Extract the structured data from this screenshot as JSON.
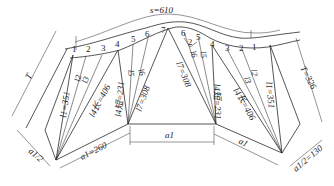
{
  "diagram": {
    "type": "sheet-metal pattern development (unfolded transition piece)",
    "arc_length_label": "s=610",
    "top_points_left": [
      "1",
      "2",
      "3",
      "4",
      "5",
      "6",
      "7"
    ],
    "top_points_right": [
      "6",
      "5",
      "4",
      "3",
      "2",
      "1"
    ],
    "labels": {
      "T_left": "T",
      "T_right": "T=326",
      "l1_left": "l1=351",
      "l1_right": "l1=351",
      "l4_long_left": "l4长=406",
      "l4_long_right": "l4长=406",
      "l4_short_left": "l4短=231",
      "l4_short_right": "l4短=231",
      "l7_left": "l7=308",
      "l7_right": "l7=308",
      "l2_left": "l2",
      "l3_left": "l3",
      "l5_left": "l5",
      "l6_left": "l6",
      "l2_right": "l2",
      "l3_right": "l3",
      "l5_right": "l5",
      "l6_right": "l6",
      "small_arc": "2",
      "a1_left": "a1=260",
      "a1_center": "a1",
      "a1_right": "a1",
      "half_a1_left": "a1/2",
      "half_a1_right": "a1/2=130"
    }
  }
}
